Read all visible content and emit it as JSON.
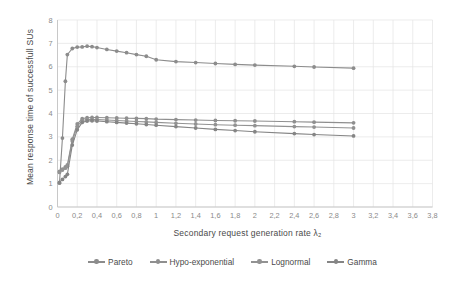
{
  "chart_data": {
    "type": "line",
    "title": "",
    "xlabel": "Secondary request generation rate λ₂",
    "ylabel": "Mean response time of successfull SUs",
    "xlim": [
      0,
      3.8
    ],
    "ylim": [
      0,
      8
    ],
    "grid": true,
    "legend_position": "bottom",
    "xticks": [
      "0",
      "0,2",
      "0,4",
      "0,6",
      "0,8",
      "1",
      "1,2",
      "1,4",
      "1,6",
      "1,8",
      "2",
      "2,2",
      "2,4",
      "2,6",
      "2,8",
      "3",
      "3,2",
      "3,4",
      "3,6",
      "3,8"
    ],
    "yticks": [
      "0",
      "1",
      "2",
      "3",
      "4",
      "5",
      "6",
      "7",
      "8"
    ],
    "x": [
      0.02,
      0.05,
      0.08,
      0.1,
      0.15,
      0.2,
      0.25,
      0.3,
      0.35,
      0.4,
      0.5,
      0.6,
      0.7,
      0.8,
      0.9,
      1.0,
      1.2,
      1.4,
      1.6,
      1.8,
      2.0,
      2.4,
      2.6,
      3.0
    ],
    "series": [
      {
        "name": "Pareto",
        "color": "#8c8c8c",
        "values": [
          1.02,
          2.95,
          5.38,
          6.52,
          6.78,
          6.84,
          6.85,
          6.88,
          6.86,
          6.82,
          6.74,
          6.67,
          6.6,
          6.52,
          6.45,
          6.3,
          6.22,
          6.18,
          6.14,
          6.1,
          6.07,
          6.02,
          5.99,
          5.94
        ]
      },
      {
        "name": "Hypo-exponential",
        "color": "#8f8f8f",
        "values": [
          1.52,
          1.62,
          1.72,
          1.8,
          2.9,
          3.55,
          3.78,
          3.82,
          3.83,
          3.83,
          3.82,
          3.81,
          3.8,
          3.79,
          3.78,
          3.76,
          3.74,
          3.72,
          3.7,
          3.69,
          3.68,
          3.65,
          3.63,
          3.6
        ]
      },
      {
        "name": "Lognormal",
        "color": "#929292",
        "values": [
          1.48,
          1.58,
          1.66,
          1.74,
          2.82,
          3.45,
          3.7,
          3.74,
          3.75,
          3.74,
          3.72,
          3.7,
          3.68,
          3.66,
          3.64,
          3.62,
          3.58,
          3.55,
          3.52,
          3.5,
          3.48,
          3.44,
          3.42,
          3.38
        ]
      },
      {
        "name": "Gamma",
        "color": "#858585",
        "values": [
          1.05,
          1.18,
          1.3,
          1.4,
          2.65,
          3.3,
          3.62,
          3.68,
          3.69,
          3.68,
          3.65,
          3.62,
          3.59,
          3.56,
          3.53,
          3.5,
          3.44,
          3.38,
          3.32,
          3.27,
          3.22,
          3.14,
          3.1,
          3.04
        ]
      }
    ]
  }
}
